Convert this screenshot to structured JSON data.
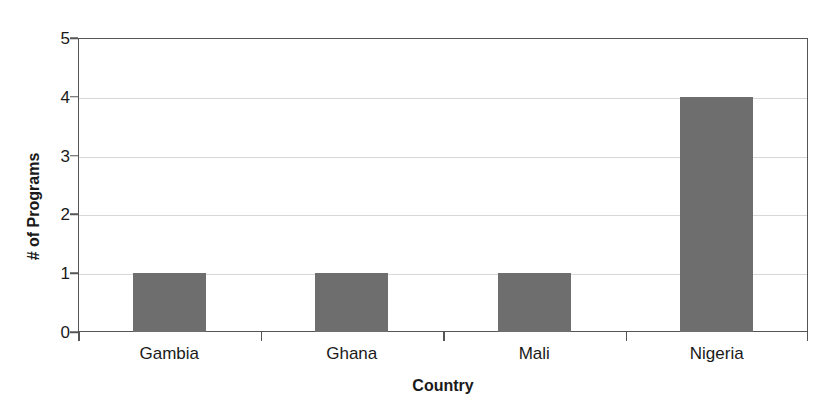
{
  "chart_data": {
    "type": "bar",
    "title": "",
    "subtitle": "",
    "xlabel": "Country",
    "ylabel": "# of Programs",
    "categories": [
      "Gambia",
      "Ghana",
      "Mali",
      "Nigeria"
    ],
    "values": [
      1,
      1,
      1,
      4
    ],
    "series": [
      {
        "name": "# of Programs",
        "values": [
          1,
          1,
          1,
          4
        ]
      }
    ],
    "ylim": [
      0,
      5
    ],
    "yticks": [
      0,
      1,
      2,
      3,
      4,
      5
    ],
    "ytick_labels": [
      "0",
      "1",
      "2",
      "3",
      "4",
      "5"
    ],
    "grid": "horizontal",
    "legend": "none",
    "legend_position": "none",
    "annotations": [],
    "bar_color": "#6e6e6e",
    "axis_color": "#555555",
    "gridline_color": "#d8d8d8",
    "background_color": "#ffffff",
    "text_color": "#1a1a1a"
  }
}
